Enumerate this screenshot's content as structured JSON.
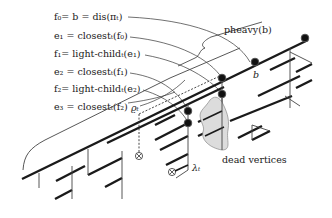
{
  "figure": {
    "labels": [
      {
        "id": "f0",
        "text": "f₀= b = dis(πₜ)"
      },
      {
        "id": "e1",
        "text": "e₁ = closestₜ(f₀)"
      },
      {
        "id": "f1",
        "text": "f₁= light-childₜ(e₁)"
      },
      {
        "id": "e2",
        "text": "e₂ = closestₜ(f₁)"
      },
      {
        "id": "f2",
        "text": "f₂= light-childₜ(e₂)"
      },
      {
        "id": "e3",
        "text": "e₃ = closestₜ(f₂)"
      }
    ],
    "brace_label": "pheavy(b)",
    "node_b_label": "b",
    "rho_label": "ϱₜ",
    "lambda_label": "λₜ",
    "blob_label": "dead vertices",
    "colors": {
      "ink": "#1a1a1a",
      "blob_fill": "#dcdcdc",
      "background": "#ffffff"
    }
  }
}
